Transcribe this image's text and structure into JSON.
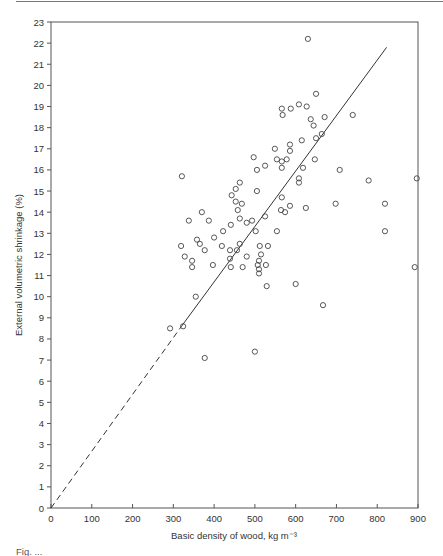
{
  "chart_data": {
    "type": "scatter",
    "title": "",
    "xlabel": "Basic density of wood, kg m⁻³",
    "ylabel": "External volumetric shrinkage (%)",
    "xlim": [
      0,
      900
    ],
    "ylim": [
      0,
      23
    ],
    "x_ticks": [
      0,
      100,
      200,
      300,
      400,
      500,
      600,
      700,
      800,
      900
    ],
    "y_ticks": [
      0,
      1,
      2,
      3,
      4,
      5,
      6,
      7,
      8,
      9,
      10,
      11,
      12,
      13,
      14,
      15,
      16,
      17,
      18,
      19,
      20,
      21,
      22,
      23
    ],
    "grid": false,
    "legend": null,
    "fit_line": {
      "dashed_segment": {
        "x": [
          0,
          320
        ],
        "y": [
          0,
          8.6
        ]
      },
      "solid_segment": {
        "x": [
          320,
          823
        ],
        "y": [
          8.6,
          21.8
        ]
      }
    },
    "series": [
      {
        "name": "observations",
        "marker": "open-circle",
        "points": [
          [
            630,
            22.2
          ],
          [
            650,
            19.6
          ],
          [
            566,
            18.9
          ],
          [
            568,
            18.6
          ],
          [
            588,
            18.9
          ],
          [
            608,
            19.1
          ],
          [
            627,
            19.0
          ],
          [
            637,
            18.4
          ],
          [
            644,
            18.1
          ],
          [
            671,
            18.5
          ],
          [
            740,
            18.6
          ],
          [
            664,
            17.7
          ],
          [
            650,
            17.5
          ],
          [
            615,
            17.4
          ],
          [
            586,
            17.2
          ],
          [
            586,
            16.9
          ],
          [
            549,
            17.0
          ],
          [
            497,
            16.6
          ],
          [
            554,
            16.5
          ],
          [
            566,
            16.4
          ],
          [
            578,
            16.5
          ],
          [
            566,
            16.1
          ],
          [
            525,
            16.2
          ],
          [
            505,
            16.0
          ],
          [
            647,
            16.5
          ],
          [
            618,
            16.1
          ],
          [
            708,
            16.0
          ],
          [
            608,
            15.6
          ],
          [
            608,
            15.4
          ],
          [
            505,
            15.0
          ],
          [
            566,
            14.7
          ],
          [
            586,
            14.3
          ],
          [
            625,
            14.2
          ],
          [
            698,
            14.4
          ],
          [
            564,
            14.1
          ],
          [
            574,
            14.0
          ],
          [
            525,
            13.8
          ],
          [
            463,
            15.4
          ],
          [
            453,
            15.1
          ],
          [
            443,
            14.8
          ],
          [
            453,
            14.5
          ],
          [
            468,
            14.4
          ],
          [
            458,
            14.1
          ],
          [
            463,
            13.7
          ],
          [
            480,
            13.5
          ],
          [
            493,
            13.6
          ],
          [
            321,
            15.7
          ],
          [
            338,
            13.6
          ],
          [
            370,
            14.0
          ],
          [
            387,
            13.6
          ],
          [
            441,
            13.4
          ],
          [
            422,
            13.1
          ],
          [
            502,
            13.1
          ],
          [
            554,
            13.1
          ],
          [
            400,
            12.8
          ],
          [
            358,
            12.7
          ],
          [
            365,
            12.5
          ],
          [
            377,
            12.2
          ],
          [
            319,
            12.4
          ],
          [
            328,
            11.9
          ],
          [
            419,
            12.4
          ],
          [
            463,
            12.5
          ],
          [
            439,
            12.2
          ],
          [
            456,
            12.2
          ],
          [
            512,
            12.4
          ],
          [
            532,
            12.4
          ],
          [
            515,
            12.0
          ],
          [
            480,
            11.9
          ],
          [
            439,
            11.8
          ],
          [
            510,
            11.7
          ],
          [
            527,
            11.5
          ],
          [
            507,
            11.5
          ],
          [
            510,
            11.3
          ],
          [
            441,
            11.4
          ],
          [
            470,
            11.4
          ],
          [
            397,
            11.5
          ],
          [
            346,
            11.7
          ],
          [
            346,
            11.4
          ],
          [
            510,
            11.1
          ],
          [
            355,
            10.0
          ],
          [
            529,
            10.5
          ],
          [
            600,
            10.6
          ],
          [
            667,
            9.6
          ],
          [
            292,
            8.5
          ],
          [
            324,
            8.6
          ],
          [
            377,
            7.1
          ],
          [
            500,
            7.4
          ],
          [
            779,
            15.5
          ],
          [
            897,
            15.6
          ],
          [
            819,
            14.4
          ],
          [
            819,
            13.1
          ],
          [
            892,
            11.4
          ]
        ]
      }
    ]
  },
  "caption": "Fig. ..."
}
